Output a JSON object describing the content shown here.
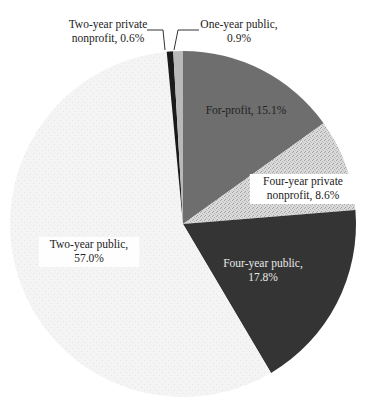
{
  "chart_data": {
    "type": "pie",
    "title": "",
    "start": "top",
    "direction": "clockwise",
    "slices": [
      {
        "label": "For-profit",
        "value": 15.1,
        "display": "For-profit, 15.1%",
        "lines": [
          "For-profit, 15.1%"
        ],
        "color": "#6e6e6e",
        "pattern": "none",
        "text_color": "#222222",
        "label_bg": false,
        "leader": false
      },
      {
        "label": "Four-year private nonprofit",
        "value": 8.6,
        "display": "Four-year private nonprofit, 8.6%",
        "lines": [
          "Four-year private",
          "nonprofit, 8.6%"
        ],
        "color": "#d8d8d8",
        "pattern": "speckle",
        "text_color": "#222222",
        "label_bg": true,
        "leader": false
      },
      {
        "label": "Four-year public",
        "value": 17.8,
        "display": "Four-year public, 17.8%",
        "lines": [
          "Four-year public,",
          "17.8%"
        ],
        "color": "#343434",
        "pattern": "none",
        "text_color": "#e8e8e8",
        "label_bg": false,
        "leader": false
      },
      {
        "label": "Two-year public",
        "value": 57.0,
        "display": "Two-year public, 57.0%",
        "lines": [
          "Two-year public,",
          "57.0%"
        ],
        "color": "#f3f3f3",
        "pattern": "grid",
        "text_color": "#222222",
        "label_bg": true,
        "leader": false
      },
      {
        "label": "Two-year private nonprofit",
        "value": 0.6,
        "display": "Two-year private nonprofit, 0.6%",
        "lines": [
          "Two-year private",
          "nonprofit, 0.6%"
        ],
        "color": "#1a1a1a",
        "pattern": "none",
        "text_color": "#222222",
        "label_bg": false,
        "leader": true
      },
      {
        "label": "One-year public",
        "value": 0.9,
        "display": "One-year public, 0.9%",
        "lines": [
          "One-year public,",
          "0.9%"
        ],
        "color": "#b9b9b9",
        "pattern": "none",
        "text_color": "#222222",
        "label_bg": false,
        "leader": true
      }
    ],
    "legend": "none"
  }
}
